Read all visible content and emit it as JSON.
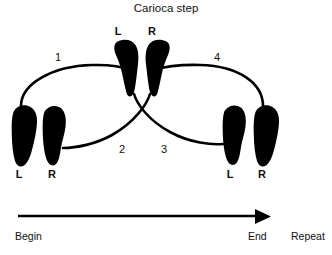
{
  "figure": {
    "title": "Carioca step",
    "background_color": "#ffffff",
    "ink_color": "#000000"
  },
  "footprints": {
    "center_left": {
      "label": "L",
      "side": "left"
    },
    "center_right": {
      "label": "R",
      "side": "right"
    },
    "start_left": {
      "label": "L",
      "side": "left"
    },
    "start_right": {
      "label": "R",
      "side": "right"
    },
    "finish_left": {
      "label": "L",
      "side": "left"
    },
    "finish_right": {
      "label": "R",
      "side": "right"
    }
  },
  "steps": [
    {
      "number": "1",
      "from": "start-left-foot",
      "to": "center-left-foot"
    },
    {
      "number": "2",
      "from": "center-right-foot",
      "to": "start-right-foot"
    },
    {
      "number": "3",
      "from": "center-left-foot",
      "to": "finish-left-foot"
    },
    {
      "number": "4",
      "from": "center-right-foot",
      "to": "finish-right-foot"
    }
  ],
  "step_labels": {
    "one": "1",
    "two": "2",
    "three": "3",
    "four": "4"
  },
  "direction_axis": {
    "begin_label": "Begin",
    "end_label": "End",
    "repeat_label": "Repeat"
  }
}
